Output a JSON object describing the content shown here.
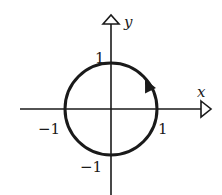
{
  "diagram": {
    "type": "unit-circle-contour",
    "axes": {
      "x_label": "x",
      "y_label": "y"
    },
    "ticks": {
      "y_pos": "1",
      "x_neg": "−1",
      "x_pos": "1",
      "y_neg": "−1"
    },
    "circle": {
      "radius": 1,
      "orientation": "counterclockwise"
    },
    "colors": {
      "stroke": "#1a1a1a",
      "background": "#ffffff"
    }
  }
}
